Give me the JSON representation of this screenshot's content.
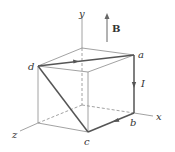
{
  "diagram": {
    "type": "3D cube current loop in magnetic field",
    "colors": {
      "thin_line": "#8a8a8a",
      "thick_line": "#555555",
      "label": "#333333"
    },
    "axes": {
      "x_label": "x",
      "y_label": "y",
      "z_label": "z"
    },
    "field": {
      "label": "B",
      "direction": "+y"
    },
    "current": {
      "label": "I",
      "path": [
        "d",
        "a",
        "b",
        "c",
        "d"
      ]
    },
    "points": {
      "a": "a",
      "b": "b",
      "c": "c",
      "d": "d"
    }
  }
}
